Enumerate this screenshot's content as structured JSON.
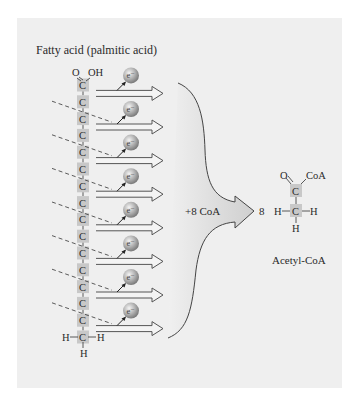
{
  "title": "Fatty acid (palmitic acid)",
  "chain": {
    "carbon_label": "C",
    "carbon_count": 16,
    "carboxyl_o": "O",
    "carboxyl_oh": "OH",
    "terminal_h_left": "H",
    "terminal_h_right": "H",
    "terminal_h_bottom": "H"
  },
  "electron_label": "e⁻",
  "electron_count": 8,
  "merge_arrow_label": "+8 CoA",
  "product": {
    "coefficient": "8",
    "name": "Acetyl-CoA",
    "atoms": {
      "o": "O",
      "coa": "CoA",
      "c1": "C",
      "c2": "C",
      "h_left": "H",
      "h_right": "H",
      "h_bottom": "H"
    }
  },
  "colors": {
    "panel_bg": "#efefef",
    "carbon_box": "#c8c8c8",
    "arrow_stroke": "#555555",
    "big_arrow_fill": "#d6d6d6",
    "sphere": "#9a9a9a"
  }
}
